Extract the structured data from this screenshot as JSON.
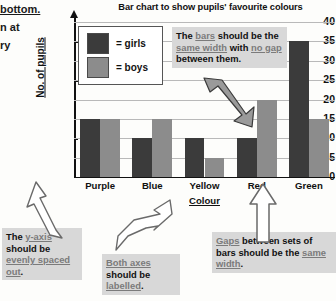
{
  "left_margin_text": {
    "lines": [
      {
        "text": "bottom.",
        "underline": true
      },
      {
        "text": "n at",
        "underline": false
      },
      {
        "text": "ry",
        "underline": false
      }
    ]
  },
  "chart_data": {
    "type": "bar",
    "title": "Bar chart to show pupils' favourite colours",
    "xlabel": "Colour",
    "ylabel": "No. of pupils",
    "categories": [
      "Purple",
      "Blue",
      "Yellow",
      "Red",
      "Green"
    ],
    "series": [
      {
        "name": "girls",
        "values": [
          15,
          10,
          10,
          10,
          35
        ],
        "color": "#3b3b3b"
      },
      {
        "name": "boys",
        "values": [
          15,
          15,
          5,
          20,
          15
        ],
        "color": "#8c8c8c"
      }
    ],
    "yticks": [
      0,
      5,
      10,
      15,
      20,
      25,
      30,
      35,
      40
    ],
    "ylim": [
      0,
      40
    ],
    "grid": true,
    "legend_position": "inside-top-left"
  },
  "legend": {
    "rows": [
      {
        "swatch": "girls",
        "label": "= girls"
      },
      {
        "swatch": "boys",
        "label": "= boys"
      }
    ]
  },
  "annotations": {
    "bars": {
      "parts": [
        {
          "t": "The ",
          "u": false
        },
        {
          "t": "bars",
          "u": true
        },
        {
          "t": " should be the ",
          "u": false
        },
        {
          "t": "same width",
          "u": true
        },
        {
          "t": " with ",
          "u": false
        },
        {
          "t": "no gap",
          "u": true
        },
        {
          "t": " between them.",
          "u": false
        }
      ]
    },
    "yaxis": {
      "parts": [
        {
          "t": "The ",
          "u": false
        },
        {
          "t": "y-axis",
          "u": true
        },
        {
          "t": " should be ",
          "u": false
        },
        {
          "t": "evenly spaced out",
          "u": true
        },
        {
          "t": ".",
          "u": false
        }
      ]
    },
    "axes": {
      "parts": [
        {
          "t": "Both axes",
          "u": true
        },
        {
          "t": " should be ",
          "u": false
        },
        {
          "t": "labelled",
          "u": true
        },
        {
          "t": ".",
          "u": false
        }
      ]
    },
    "gaps": {
      "parts": [
        {
          "t": "Gaps",
          "u": true
        },
        {
          "t": " between sets of bars should be the ",
          "u": false
        },
        {
          "t": "same width",
          "u": true
        },
        {
          "t": ".",
          "u": false
        }
      ]
    }
  }
}
